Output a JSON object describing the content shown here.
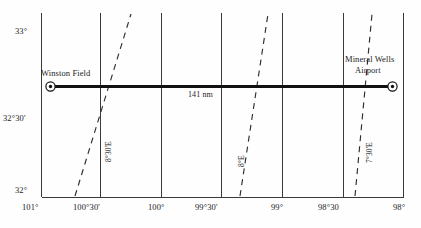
{
  "figure": {
    "type": "navigation-chart"
  },
  "axes": {
    "latitude": {
      "label_top": "33°",
      "label_mid": "32°30'",
      "label_bottom": "32°",
      "ticks": [
        "33°",
        "32°30'",
        "32°"
      ],
      "range": [
        "32°",
        "33°"
      ]
    },
    "longitude": {
      "ticks": [
        "101°",
        "100°30'",
        "100°",
        "99°30'",
        "99°",
        "98°30",
        "98°"
      ],
      "range": [
        "101°",
        "98°"
      ]
    }
  },
  "places": [
    {
      "name": "Winston Field",
      "marker": "airport-dot-circle",
      "label_lines": [
        "Winston Field"
      ]
    },
    {
      "name": "Mineral Wells Airport",
      "marker": "airport-dot-circle",
      "label_lines": [
        "Mineral Wells",
        "Airport"
      ]
    }
  ],
  "route": {
    "distance_label": "141 nm",
    "from": "Winston Field",
    "to": "Mineral Wells Airport"
  },
  "isogonic_lines": [
    {
      "label": "8°30'E",
      "value": "8°30'",
      "hemisphere": "E"
    },
    {
      "label": "8°E",
      "value": "8°",
      "hemisphere": "E"
    },
    {
      "label": "7°30'E",
      "value": "7°30'",
      "hemisphere": "E"
    }
  ],
  "colors": {
    "grid": "#3a3a3a",
    "route": "#111111",
    "isogonic": "#2e2e2e",
    "text": "#1a1a1a",
    "background": "#ffffff"
  }
}
